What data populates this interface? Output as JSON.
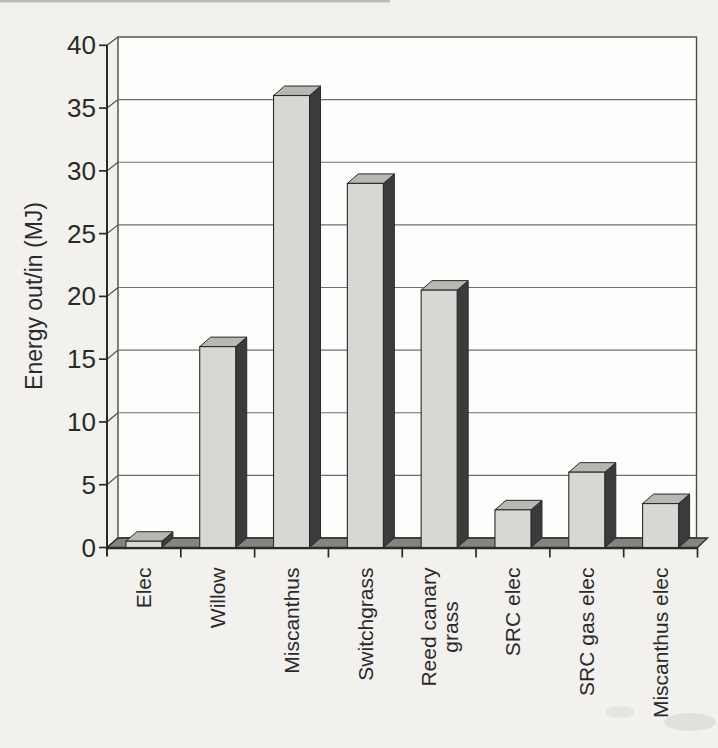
{
  "figure": {
    "kind": "scanned-book-figure",
    "page_background": "#f2f1ed",
    "plot_background": "#fdfdfc"
  },
  "chart_data": {
    "type": "bar",
    "style": "3d-column",
    "title": "",
    "xlabel": "",
    "ylabel": "Energy out/in (MJ)",
    "ylim": [
      0,
      40
    ],
    "ytick_step": 5,
    "yticks": [
      0,
      5,
      10,
      15,
      20,
      25,
      30,
      35,
      40
    ],
    "grid": true,
    "legend_position": "none",
    "categories": [
      "Elec",
      "Willow",
      "Miscanthus",
      "Switchgrass",
      "Reed canary\ngrass",
      "SRC elec",
      "SRC gas elec",
      "Miscanthus elec"
    ],
    "values": [
      0.5,
      16,
      36,
      29,
      20.5,
      3,
      6,
      3.5
    ],
    "colors": {
      "bar_front": "#d8d7d3",
      "bar_top": "#b8b7b3",
      "bar_side": "#3b3b3b",
      "floor": "#85847f",
      "gridline": "#6f6f6f",
      "wall_edge": "#4a4a4a",
      "axis": "#2a2a2a",
      "text": "#2a2a2a"
    }
  }
}
